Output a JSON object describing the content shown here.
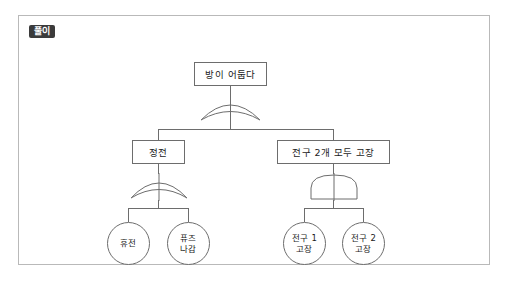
{
  "page": {
    "background_color": "#ffffff",
    "frame_border_color": "#b9b9b9",
    "line_color": "#6d6d6d",
    "text_color": "#1b1b1b"
  },
  "badge": {
    "label": "풀이",
    "background_color": "#3b3b3b",
    "text_color": "#ffffff"
  },
  "diagram": {
    "type": "fault-tree",
    "title": "방이 어둡다",
    "nodes": {
      "top": {
        "label": "방이 어둡다",
        "shape": "rect"
      },
      "mid_left": {
        "label": "정전",
        "shape": "rect"
      },
      "mid_right": {
        "label": "전구 2개 모두 고장",
        "shape": "rect"
      },
      "leaf_1": {
        "line1": "휴전",
        "line2": "",
        "shape": "circle"
      },
      "leaf_2": {
        "line1": "퓨즈",
        "line2": "나감",
        "shape": "circle"
      },
      "leaf_3": {
        "line1": "전구 1",
        "line2": "고장",
        "shape": "circle"
      },
      "leaf_4": {
        "line1": "전구 2",
        "line2": "고장",
        "shape": "circle"
      }
    },
    "gates": {
      "top_gate": {
        "type": "OR",
        "name": "or-gate-top"
      },
      "left_gate": {
        "type": "OR",
        "name": "or-gate-left"
      },
      "right_gate": {
        "type": "AND",
        "name": "and-gate-right"
      }
    }
  }
}
